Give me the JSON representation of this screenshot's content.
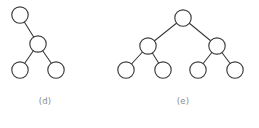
{
  "figure": {
    "background_color": "#ffffff",
    "stroke_color": "#3a3a3a",
    "node_fill_color": "#ffffff",
    "caption_color": "#8a8a8a",
    "node_radius": 8.2,
    "width": 259,
    "height": 128
  },
  "diagrams": [
    {
      "id": "tree-d",
      "caption": "(d)",
      "caption_x": 45,
      "caption_y": 104,
      "description": "binary tree with root, one right child, and two leaves",
      "node_count": 4,
      "edge_count": 3,
      "nodes": [
        {
          "name": "d-node-root",
          "x": 20,
          "y": 15,
          "level": 0,
          "label": ""
        },
        {
          "name": "d-node-right-child",
          "x": 38,
          "y": 44,
          "level": 1,
          "label": ""
        },
        {
          "name": "d-node-leaf-left",
          "x": 20,
          "y": 70,
          "level": 2,
          "label": ""
        },
        {
          "name": "d-node-leaf-right",
          "x": 56,
          "y": 70,
          "level": 2,
          "label": ""
        }
      ],
      "edges": [
        {
          "name": "d-edge-root-to-child",
          "x1": 20,
          "y1": 15,
          "x2": 38,
          "y2": 44
        },
        {
          "name": "d-edge-child-to-leaf-left",
          "x1": 38,
          "y1": 44,
          "x2": 20,
          "y2": 70
        },
        {
          "name": "d-edge-child-to-leaf-right",
          "x1": 38,
          "y1": 44,
          "x2": 56,
          "y2": 70
        }
      ]
    },
    {
      "id": "tree-e",
      "caption": "(e)",
      "caption_x": 183,
      "caption_y": 104,
      "description": "complete binary tree of depth two with seven nodes",
      "node_count": 7,
      "edge_count": 6,
      "nodes": [
        {
          "name": "e-node-root",
          "x": 183,
          "y": 18,
          "level": 0,
          "label": ""
        },
        {
          "name": "e-node-left-child",
          "x": 148,
          "y": 46,
          "level": 1,
          "label": ""
        },
        {
          "name": "e-node-right-child",
          "x": 217,
          "y": 46,
          "level": 1,
          "label": ""
        },
        {
          "name": "e-node-leaf-1",
          "x": 126,
          "y": 70,
          "level": 2,
          "label": ""
        },
        {
          "name": "e-node-leaf-2",
          "x": 163,
          "y": 70,
          "level": 2,
          "label": ""
        },
        {
          "name": "e-node-leaf-3",
          "x": 198,
          "y": 70,
          "level": 2,
          "label": ""
        },
        {
          "name": "e-node-leaf-4",
          "x": 235,
          "y": 70,
          "level": 2,
          "label": ""
        }
      ],
      "edges": [
        {
          "name": "e-edge-root-to-left",
          "x1": 183,
          "y1": 18,
          "x2": 148,
          "y2": 46
        },
        {
          "name": "e-edge-root-to-right",
          "x1": 183,
          "y1": 18,
          "x2": 217,
          "y2": 46
        },
        {
          "name": "e-edge-left-to-leaf-1",
          "x1": 148,
          "y1": 46,
          "x2": 126,
          "y2": 70
        },
        {
          "name": "e-edge-left-to-leaf-2",
          "x1": 148,
          "y1": 46,
          "x2": 163,
          "y2": 70
        },
        {
          "name": "e-edge-right-to-leaf-3",
          "x1": 217,
          "y1": 46,
          "x2": 198,
          "y2": 70
        },
        {
          "name": "e-edge-right-to-leaf-4",
          "x1": 217,
          "y1": 46,
          "x2": 235,
          "y2": 70
        }
      ]
    }
  ]
}
